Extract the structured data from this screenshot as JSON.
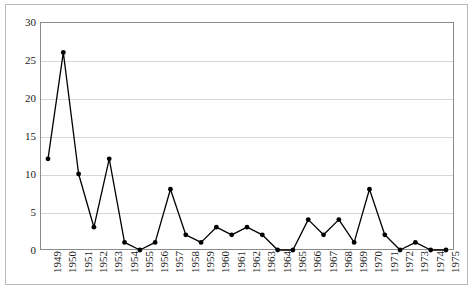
{
  "chart_data": {
    "type": "line",
    "title": "",
    "subtitle": "",
    "xlabel": "",
    "ylabel": "",
    "categories": [
      "1949",
      "1950",
      "1951",
      "1952",
      "1953",
      "1954",
      "1955",
      "1956",
      "1957",
      "1958",
      "1959",
      "1960",
      "1961",
      "1962",
      "1963",
      "1964",
      "1965",
      "1966",
      "1967",
      "1968",
      "1969",
      "1970",
      "1971",
      "1972",
      "1973",
      "1974",
      "1975"
    ],
    "values": [
      12,
      26,
      10,
      3,
      12,
      1,
      0,
      1,
      8,
      2,
      1,
      3,
      2,
      3,
      2,
      0,
      0,
      4,
      2,
      4,
      1,
      8,
      2,
      0,
      1,
      0,
      0
    ],
    "series": [
      {
        "name": "",
        "values": [
          12,
          26,
          10,
          3,
          12,
          1,
          0,
          1,
          8,
          2,
          1,
          3,
          2,
          3,
          2,
          0,
          0,
          4,
          2,
          4,
          1,
          8,
          2,
          0,
          1,
          0,
          0
        ]
      }
    ],
    "ylim": [
      0,
      30
    ],
    "yticks": [
      0,
      5,
      10,
      15,
      20,
      25,
      30
    ],
    "ytick_labels": [
      "0",
      "5",
      "10",
      "15",
      "20",
      "25",
      "30"
    ],
    "grid": "horizontal",
    "legend": "none",
    "marker": "filled-circle",
    "line_color": "#000000",
    "marker_color": "#000000",
    "grid_color": "#d6d6d6",
    "plot_border_color": "#8a8a8a",
    "frame_border_color": "#b9b9b9",
    "background_color": "#ffffff",
    "xtick_rotation": -90
  }
}
